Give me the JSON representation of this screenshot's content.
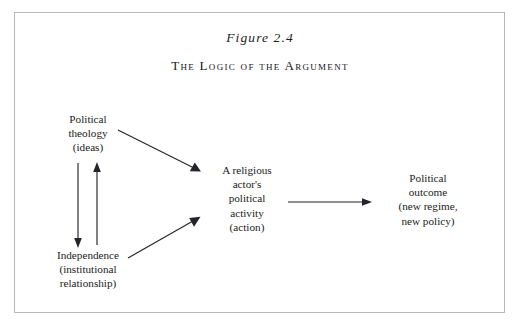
{
  "figure": {
    "number": "Figure 2.4",
    "title": "The Logic of the Argument",
    "frame_color": "#b9b9b4",
    "ink_color": "#1b1b22",
    "background": "#ffffff"
  },
  "nodes": {
    "political_theology": {
      "name": "Political theology (ideas)",
      "lines": [
        "Political",
        "theology",
        "(ideas)"
      ]
    },
    "independence": {
      "name": "Independence (institutional relationship)",
      "lines": [
        "Independence",
        "(institutional",
        "relationship)"
      ]
    },
    "religious_activity": {
      "name": "A religious actor's political activity (action)",
      "lines": [
        "A religious",
        "actor's",
        "political",
        "activity",
        "(action)"
      ]
    },
    "political_outcome": {
      "name": "Political outcome (new regime, new policy)",
      "lines": [
        "Political",
        "outcome",
        "(new regime,",
        "new policy)"
      ]
    }
  },
  "arrows": [
    {
      "id": "theology-to-independence",
      "from": "political_theology",
      "to": "independence",
      "direction": "down"
    },
    {
      "id": "independence-to-theology",
      "from": "independence",
      "to": "political_theology",
      "direction": "up"
    },
    {
      "id": "theology-to-activity",
      "from": "political_theology",
      "to": "religious_activity",
      "direction": "down-right"
    },
    {
      "id": "independence-to-activity",
      "from": "independence",
      "to": "religious_activity",
      "direction": "up-right"
    },
    {
      "id": "activity-to-outcome",
      "from": "religious_activity",
      "to": "political_outcome",
      "direction": "right"
    }
  ]
}
